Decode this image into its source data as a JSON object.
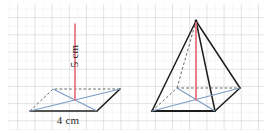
{
  "figure": {
    "background_color": "#ffffff",
    "grid": {
      "minor_color": "#e9eaee",
      "major_color": "#c9ccd4",
      "minor_spacing_px": 8.6,
      "major_spacing_px": 17.2,
      "visible": true
    },
    "colors": {
      "solid_edge": "#1d1d1b",
      "hidden_edge": "#3a3a38",
      "diagonal_blue": "#7d9dc4",
      "height_red": "#e8707f",
      "height_red_dark": "#d4495c",
      "label_text": "#2a2a2a"
    },
    "labels": [
      {
        "id": "height-label",
        "text": "5 cm",
        "orientation": "vertical",
        "x": 78,
        "y": 56,
        "rotation_deg": -90
      },
      {
        "id": "base-label",
        "text": "4 cm",
        "orientation": "horizontal",
        "x": 68,
        "y": 123,
        "rotation_deg": 0
      }
    ],
    "shapes": {
      "left_figure": {
        "name": "pyramid-base-with-height",
        "description": "Flattened square base drawn in perspective with both diagonals and a vertical perpendicular height from the centre.",
        "base_vertices": {
          "front_left": [
            30,
            111
          ],
          "front_right": [
            97,
            111
          ],
          "back_right": [
            120,
            89
          ],
          "back_left": [
            53,
            89
          ]
        },
        "centre": [
          75,
          100
        ],
        "apex": [
          75,
          24
        ],
        "diagonals": [
          [
            [
              30,
              111
            ],
            [
              120,
              89
            ]
          ],
          [
            [
              97,
              111
            ],
            [
              53,
              89
            ]
          ]
        ]
      },
      "right_figure": {
        "name": "square-pyramid-solid",
        "description": "Square pyramid in perspective with visible edges, hidden back edges dashed, base diagonals and vertical height.",
        "base_vertices": {
          "front_left": [
            152,
            111
          ],
          "front_right": [
            215,
            111
          ],
          "back_right": [
            240,
            88
          ],
          "back_left": [
            177,
            88
          ]
        },
        "centre": [
          196,
          100
        ],
        "apex": [
          196,
          21
        ],
        "diagonals": [
          [
            [
              152,
              111
            ],
            [
              240,
              88
            ]
          ],
          [
            [
              215,
              111
            ],
            [
              177,
              88
            ]
          ]
        ]
      }
    }
  }
}
